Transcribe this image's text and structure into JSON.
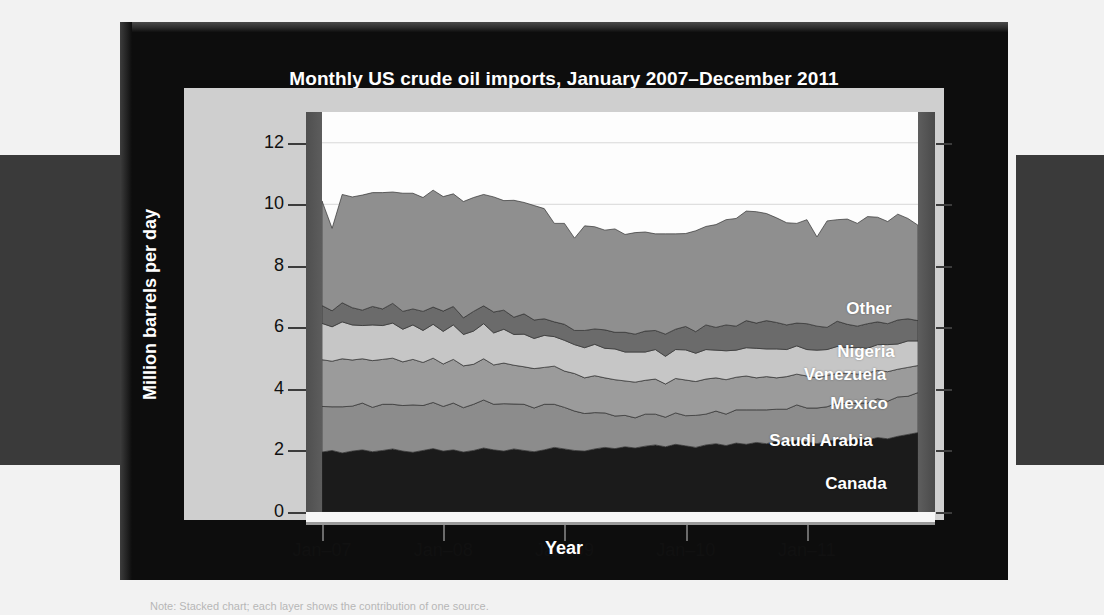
{
  "figure": {
    "title": "Monthly US crude oil imports, January 2007–December 2011",
    "xlabel": "Year",
    "ylabel": "Million barrels per day",
    "caption": "Note: Stacked chart; each layer shows the contribution of one source."
  },
  "chart_data": {
    "type": "area",
    "stacked": true,
    "title": "Monthly US crude oil imports, January 2007–December 2011",
    "xlabel": "Year",
    "ylabel": "Million barrels per day",
    "ylim": [
      0,
      13
    ],
    "yticks": [
      0,
      2,
      4,
      6,
      8,
      10,
      12
    ],
    "ytick_labels": [
      "0",
      "2",
      "4",
      "6",
      "8",
      "10",
      "12"
    ],
    "xlim": [
      "2007-01",
      "2011-12"
    ],
    "xticks": [
      "Jan–07",
      "Jan–08",
      "Jan–09",
      "Jan–10",
      "Jan–11"
    ],
    "xtick_positions_months": [
      0,
      12,
      24,
      36,
      48
    ],
    "grid": true,
    "legend_position": "inline-labels",
    "n_points": 60,
    "x": [
      "2007-01",
      "2007-02",
      "2007-03",
      "2007-04",
      "2007-05",
      "2007-06",
      "2007-07",
      "2007-08",
      "2007-09",
      "2007-10",
      "2007-11",
      "2007-12",
      "2008-01",
      "2008-02",
      "2008-03",
      "2008-04",
      "2008-05",
      "2008-06",
      "2008-07",
      "2008-08",
      "2008-09",
      "2008-10",
      "2008-11",
      "2008-12",
      "2009-01",
      "2009-02",
      "2009-03",
      "2009-04",
      "2009-05",
      "2009-06",
      "2009-07",
      "2009-08",
      "2009-09",
      "2009-10",
      "2009-11",
      "2009-12",
      "2010-01",
      "2010-02",
      "2010-03",
      "2010-04",
      "2010-05",
      "2010-06",
      "2010-07",
      "2010-08",
      "2010-09",
      "2010-10",
      "2010-11",
      "2010-12",
      "2011-01",
      "2011-02",
      "2011-03",
      "2011-04",
      "2011-05",
      "2011-06",
      "2011-07",
      "2011-08",
      "2011-09",
      "2011-10",
      "2011-11",
      "2011-12"
    ],
    "series": [
      {
        "name": "Canada",
        "color": "#1b1b1b",
        "label_color": "#ffffff",
        "values": [
          1.95,
          2.0,
          1.92,
          1.98,
          2.02,
          1.96,
          2.0,
          2.05,
          1.98,
          1.94,
          2.0,
          2.06,
          1.98,
          2.02,
          1.95,
          2.0,
          2.08,
          2.02,
          1.98,
          2.05,
          2.0,
          1.96,
          2.02,
          2.1,
          2.05,
          2.0,
          1.98,
          2.05,
          2.1,
          2.06,
          2.12,
          2.08,
          2.14,
          2.18,
          2.12,
          2.2,
          2.15,
          2.1,
          2.18,
          2.22,
          2.16,
          2.24,
          2.2,
          2.26,
          2.22,
          2.3,
          2.26,
          2.34,
          2.28,
          2.22,
          2.3,
          2.36,
          2.3,
          2.38,
          2.34,
          2.42,
          2.38,
          2.46,
          2.52,
          2.58
        ]
      },
      {
        "name": "Saudi Arabia",
        "color": "#8c8c8c",
        "label_color": "#ffffff",
        "values": [
          1.48,
          1.42,
          1.5,
          1.46,
          1.52,
          1.44,
          1.5,
          1.45,
          1.48,
          1.54,
          1.46,
          1.5,
          1.45,
          1.52,
          1.44,
          1.5,
          1.56,
          1.48,
          1.54,
          1.46,
          1.5,
          1.42,
          1.48,
          1.4,
          1.35,
          1.28,
          1.22,
          1.18,
          1.12,
          1.06,
          1.02,
          0.98,
          1.04,
          1.0,
          0.96,
          1.02,
          0.98,
          1.04,
          1.0,
          1.06,
          1.02,
          1.08,
          1.12,
          1.06,
          1.1,
          1.04,
          1.08,
          1.14,
          1.1,
          1.16,
          1.12,
          1.18,
          1.22,
          1.16,
          1.2,
          1.26,
          1.22,
          1.28,
          1.24,
          1.3
        ]
      },
      {
        "name": "Mexico",
        "color": "#9b9b9b",
        "label_color": "#ffffff",
        "values": [
          1.52,
          1.48,
          1.56,
          1.5,
          1.44,
          1.52,
          1.46,
          1.5,
          1.42,
          1.48,
          1.4,
          1.44,
          1.38,
          1.42,
          1.36,
          1.3,
          1.34,
          1.28,
          1.32,
          1.26,
          1.22,
          1.28,
          1.2,
          1.24,
          1.18,
          1.22,
          1.16,
          1.2,
          1.14,
          1.18,
          1.12,
          1.16,
          1.1,
          1.14,
          1.08,
          1.12,
          1.16,
          1.1,
          1.14,
          1.08,
          1.12,
          1.06,
          1.1,
          1.04,
          1.08,
          1.02,
          1.06,
          1.0,
          1.04,
          0.98,
          1.02,
          0.96,
          1.0,
          0.94,
          0.98,
          0.92,
          0.96,
          0.9,
          0.94,
          0.88
        ]
      },
      {
        "name": "Venezuela",
        "color": "#c6c6c6",
        "label_color": "#ffffff",
        "values": [
          1.18,
          1.12,
          1.2,
          1.14,
          1.08,
          1.16,
          1.1,
          1.14,
          1.06,
          1.12,
          1.04,
          1.1,
          1.06,
          1.12,
          1.02,
          1.08,
          1.14,
          1.04,
          1.1,
          1.0,
          1.06,
          0.98,
          1.04,
          0.96,
          1.0,
          0.94,
          0.98,
          1.02,
          0.96,
          1.0,
          0.94,
          0.98,
          0.92,
          0.96,
          0.9,
          0.94,
          0.98,
          0.92,
          0.96,
          0.9,
          0.94,
          0.88,
          0.92,
          0.96,
          0.9,
          0.94,
          0.88,
          0.92,
          0.86,
          0.9,
          0.84,
          0.88,
          0.82,
          0.86,
          0.8,
          0.84,
          0.88,
          0.82,
          0.86,
          0.8
        ]
      },
      {
        "name": "Nigeria",
        "color": "#6b6b6b",
        "label_color": "#ffffff",
        "values": [
          0.58,
          0.52,
          0.62,
          0.56,
          0.5,
          0.6,
          0.54,
          0.64,
          0.58,
          0.52,
          0.62,
          0.56,
          0.66,
          0.6,
          0.54,
          0.64,
          0.58,
          0.68,
          0.62,
          0.56,
          0.66,
          0.6,
          0.54,
          0.48,
          0.52,
          0.46,
          0.56,
          0.5,
          0.6,
          0.54,
          0.64,
          0.58,
          0.68,
          0.62,
          0.72,
          0.66,
          0.76,
          0.7,
          0.8,
          0.74,
          0.84,
          0.78,
          0.88,
          0.82,
          0.92,
          0.86,
          0.8,
          0.74,
          0.84,
          0.78,
          0.72,
          0.82,
          0.76,
          0.7,
          0.8,
          0.74,
          0.68,
          0.78,
          0.72,
          0.66
        ]
      },
      {
        "name": "Other",
        "color": "#8f8f8f",
        "label_color": "#ffffff",
        "values": [
          3.4,
          2.68,
          3.52,
          3.6,
          3.74,
          3.7,
          3.78,
          3.62,
          3.84,
          3.76,
          3.7,
          3.8,
          3.72,
          3.66,
          3.78,
          3.7,
          3.62,
          3.74,
          3.56,
          3.8,
          3.62,
          3.72,
          3.58,
          3.2,
          3.28,
          3.0,
          3.4,
          3.32,
          3.24,
          3.36,
          3.18,
          3.3,
          3.22,
          3.14,
          3.26,
          3.1,
          3.02,
          3.28,
          3.2,
          3.34,
          3.42,
          3.5,
          3.56,
          3.62,
          3.48,
          3.4,
          3.32,
          3.24,
          3.38,
          2.9,
          3.46,
          3.3,
          3.42,
          3.34,
          3.48,
          3.4,
          3.32,
          3.44,
          3.26,
          3.1
        ]
      }
    ],
    "series_label_positions": [
      {
        "name": "Other",
        "left": 749,
        "top": 277
      },
      {
        "name": "Nigeria",
        "left": 746,
        "top": 320
      },
      {
        "name": "Venezuela",
        "left": 725,
        "top": 343
      },
      {
        "name": "Mexico",
        "left": 739,
        "top": 372
      },
      {
        "name": "Saudi Arabia",
        "left": 701,
        "top": 409
      },
      {
        "name": "Canada",
        "left": 736,
        "top": 452
      }
    ]
  }
}
